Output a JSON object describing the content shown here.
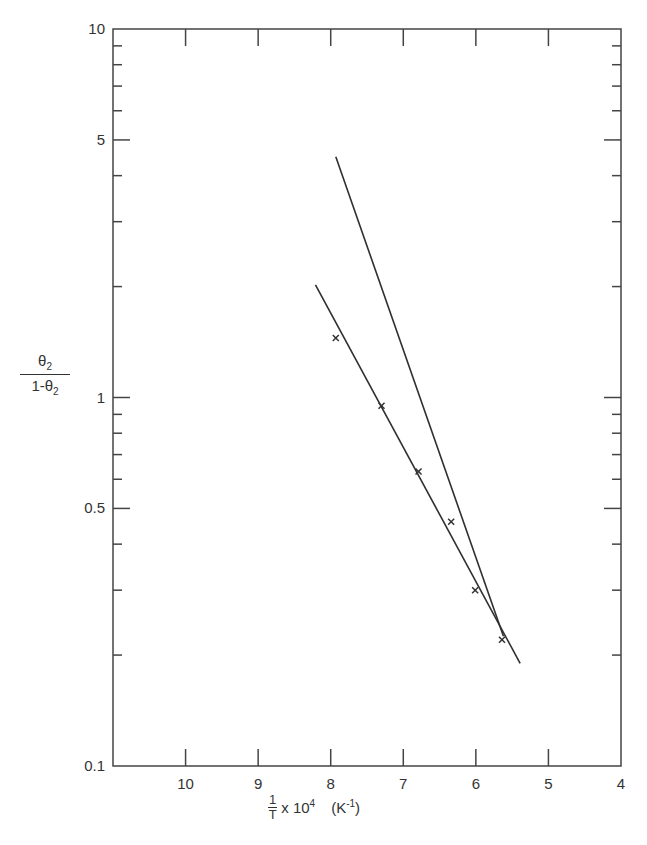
{
  "chart_data": {
    "type": "scatter",
    "title": "",
    "xlabel": "1/T x 10^4 (K^-1)",
    "xlabel_parts": {
      "numerator": "1",
      "denominator": "T",
      "multiplier": "x 10",
      "exponent": "4",
      "units": "(K",
      "units_exp": "-1",
      "units_close": ")"
    },
    "ylabel": "θ2 / (1-θ2)",
    "ylabel_parts": {
      "numerator": "θ",
      "numerator_sub": "2",
      "denominator": "1-θ",
      "denominator_sub": "2"
    },
    "x_axis": {
      "range": [
        11,
        4
      ],
      "reversed": true,
      "ticks": [
        10,
        9,
        8,
        7,
        6,
        5,
        4
      ],
      "tick_labels": [
        "10",
        "9",
        "8",
        "7",
        "6",
        "5",
        "4"
      ]
    },
    "y_axis": {
      "scale": "log",
      "range": [
        0.1,
        10
      ],
      "labeled_ticks": [
        0.1,
        0.5,
        1,
        5,
        10
      ],
      "tick_labels": [
        "0.1",
        "0.5",
        "1",
        "5",
        "10"
      ],
      "minor_ticks": [
        0.2,
        0.3,
        0.4,
        0.6,
        0.7,
        0.8,
        0.9,
        2,
        3,
        4,
        6,
        7,
        8,
        9
      ]
    },
    "grid": false,
    "legend": null,
    "series": [
      {
        "name": "data",
        "type": "scatter",
        "marker": "x",
        "x": [
          7.93,
          7.3,
          6.79,
          6.34,
          6.01,
          5.64
        ],
        "y": [
          1.45,
          0.95,
          0.63,
          0.46,
          0.3,
          0.22
        ]
      },
      {
        "name": "fit-line-shallow",
        "type": "line",
        "x": [
          8.21,
          5.39
        ],
        "y": [
          2.02,
          0.19
        ]
      },
      {
        "name": "fit-line-steep",
        "type": "line",
        "x": [
          7.93,
          5.62
        ],
        "y": [
          4.5,
          0.225
        ]
      }
    ]
  },
  "frame": {
    "left": 113,
    "right": 621,
    "top": 29,
    "bottom": 766
  },
  "colors": {
    "ink": "#333333",
    "background": "#ffffff"
  }
}
